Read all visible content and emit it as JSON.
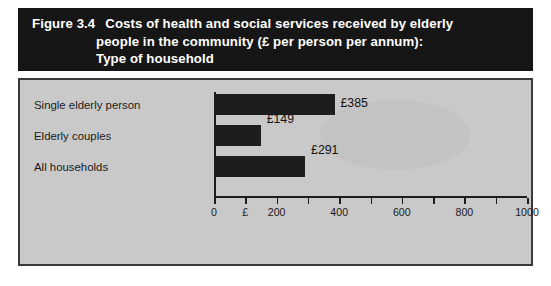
{
  "figure": {
    "number": "Figure 3.4",
    "title_lines": [
      "Costs of health and social services received by elderly",
      "people in the community (£ per person per annum):",
      "Type of household"
    ],
    "title_line1_text": "Costs of health and social services received by elderly",
    "title_line2_text": "people in the community (£ per person per annum):",
    "title_line3_text": "Type of household"
  },
  "chart_data": {
    "type": "bar",
    "orientation": "horizontal",
    "categories": [
      "Single elderly person",
      "Elderly couples",
      "All households"
    ],
    "values": [
      385,
      149,
      291
    ],
    "value_labels": [
      "£385",
      "£149",
      "£291"
    ],
    "xlabel": "",
    "ylabel": "",
    "xlim": [
      0,
      1000
    ],
    "tick_values": [
      0,
      100,
      200,
      300,
      400,
      500,
      600,
      700,
      800,
      900,
      1000
    ],
    "tick_labels": [
      "0",
      "£",
      "200",
      "",
      "400",
      "",
      "600",
      "",
      "800",
      "",
      "1000"
    ],
    "grid": false,
    "legend": null,
    "bar_color": "#1d1d1d",
    "background_color": "#c9c9c9",
    "banner_color": "#161616"
  }
}
